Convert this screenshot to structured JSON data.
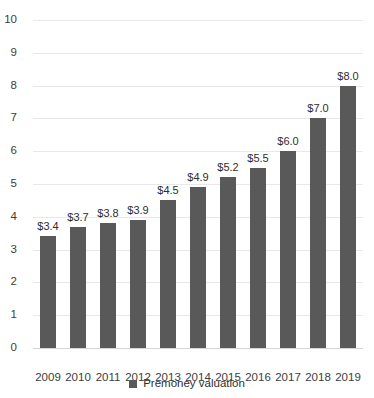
{
  "chart_data": {
    "type": "bar",
    "title": "",
    "subtitle": "",
    "xlabel": "",
    "ylabel": "",
    "categories": [
      "2009",
      "2010",
      "2011",
      "2012",
      "2013",
      "2014",
      "2015",
      "2016",
      "2017",
      "2018",
      "2019"
    ],
    "values": [
      3.4,
      3.7,
      3.8,
      3.9,
      4.5,
      4.9,
      5.2,
      5.5,
      6.0,
      7.0,
      8.0
    ],
    "point_labels": [
      "$3.4",
      "$3.7",
      "$3.8",
      "$3.9",
      "$4.5",
      "$4.9",
      "$5.2",
      "$5.5",
      "$6.0",
      "$7.0",
      "$8.0"
    ],
    "series": [
      {
        "name": "Premoney valuation",
        "values": [
          3.4,
          3.7,
          3.8,
          3.9,
          4.5,
          4.9,
          5.2,
          5.5,
          6.0,
          7.0,
          8.0
        ],
        "color": "#595959"
      }
    ],
    "ylim": [
      0,
      10
    ],
    "ytick_labels": [
      "0",
      "1",
      "2",
      "3",
      "4",
      "5",
      "6",
      "7",
      "8",
      "9",
      "10"
    ],
    "ytick_values": [
      0,
      1,
      2,
      3,
      4,
      5,
      6,
      7,
      8,
      9,
      10
    ],
    "grid": true,
    "grid_axis": "y",
    "legend": {
      "position": "bottom",
      "entries": [
        {
          "label": "Premoney valuation",
          "color": "#595959",
          "marker": "square"
        }
      ]
    },
    "colors": {
      "bar": "#595959",
      "gridline": "#e8e8e8",
      "baseline": "#d4d4d4",
      "axis_text": "#3d3d3d",
      "label_text": "#2e2e2e",
      "background": "#ffffff"
    }
  }
}
